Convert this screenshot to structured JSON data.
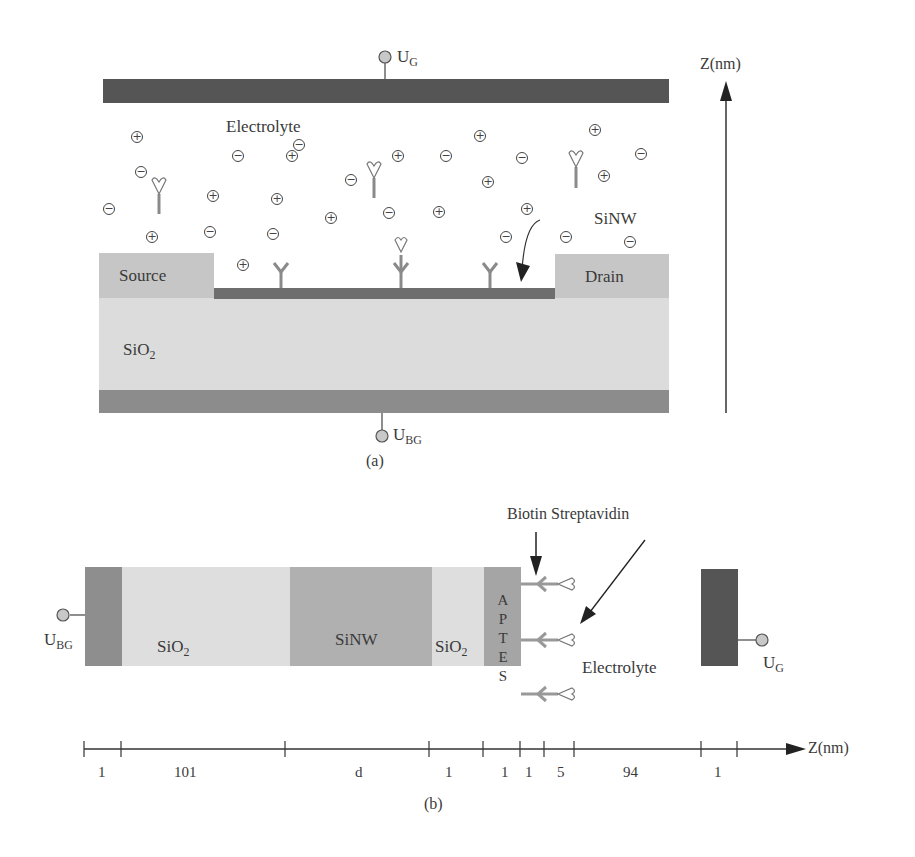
{
  "panel_a": {
    "caption": "(a)",
    "gate_label": "U",
    "gate_sub": "G",
    "backgate_label": "U",
    "backgate_sub": "BG",
    "electrolyte_label": "Electrolyte",
    "source_label": "Source",
    "drain_label": "Drain",
    "substrate_label": "SiO",
    "substrate_sub": "2",
    "sinw_label": "SiNW",
    "axis_label": "Z(nm)",
    "colors": {
      "gate": "#555555",
      "backgate": "#8c8c8c",
      "substrate": "#dcdcdc",
      "contacts": "#c4c4c4",
      "nanowire": "#6e6e6e",
      "receptor": "#8a8a8a"
    }
  },
  "panel_b": {
    "caption": "(b)",
    "title_label": "Biotin Streptavidin",
    "backgate_label": "U",
    "backgate_sub": "BG",
    "gate_label": "U",
    "gate_sub": "G",
    "electrolyte_label": "Electrolyte",
    "layers": [
      {
        "name": "backgate",
        "label": "",
        "thickness": "1"
      },
      {
        "name": "oxide",
        "label": "SiO",
        "sub": "2",
        "thickness": "101"
      },
      {
        "name": "nanowire",
        "label": "SiNW",
        "thickness": "d"
      },
      {
        "name": "oxide-thin",
        "label": "SiO",
        "sub": "2",
        "thickness": "1"
      },
      {
        "name": "aptes",
        "label": "APTES",
        "letters": [
          "A",
          "P",
          "T",
          "E",
          "S"
        ],
        "thickness": "1"
      },
      {
        "name": "biotin",
        "label": "",
        "thickness": "1"
      },
      {
        "name": "streptavidin",
        "label": "",
        "thickness": "5"
      },
      {
        "name": "electrolyte",
        "label": "Electrolyte",
        "thickness": "94"
      },
      {
        "name": "gate",
        "label": "",
        "thickness": "1"
      }
    ],
    "axis_label": "Z(nm)",
    "colors": {
      "backgate": "#8e8e8e",
      "oxide": "#dedede",
      "nanowire": "#b0b0b0",
      "aptes": "#a5a5a5",
      "gate": "#555555"
    }
  }
}
